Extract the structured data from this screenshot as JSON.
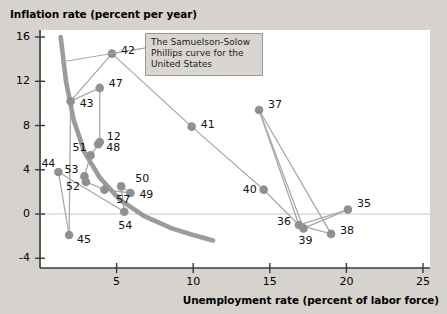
{
  "chart_data": {
    "type": "scatter",
    "title": "",
    "ylabel": "Inflation rate (percent per year)",
    "xlabel": "Unemployment rate (percent of labor force)",
    "xlim": [
      0,
      26
    ],
    "ylim": [
      -4,
      16
    ],
    "xticks": [
      5,
      10,
      15,
      20,
      25
    ],
    "yticks": [
      -4,
      0,
      4,
      8,
      12,
      16
    ],
    "grid": false,
    "zero_line": true,
    "legend": "none",
    "annotation": "The Samuelson-Solow Phillips curve for the United States",
    "point_color": "#8f9092",
    "curve_color": "#9a9b9d",
    "connector_color": "#a8a9ab",
    "points": [
      {
        "label": "35",
        "x": 20.1,
        "y": 0.4,
        "lx": 9,
        "ly": -6
      },
      {
        "label": "36",
        "x": 16.9,
        "y": -1.0,
        "lx": -22,
        "ly": -3
      },
      {
        "label": "37",
        "x": 14.3,
        "y": 9.4,
        "lx": 9,
        "ly": -5
      },
      {
        "label": "38",
        "x": 19.0,
        "y": -1.8,
        "lx": 9,
        "ly": -3
      },
      {
        "label": "39",
        "x": 17.2,
        "y": -1.3,
        "lx": -5,
        "ly": 13
      },
      {
        "label": "40",
        "x": 14.6,
        "y": 2.2,
        "lx": -21,
        "ly": 0
      },
      {
        "label": "41",
        "x": 9.9,
        "y": 7.9,
        "lx": 9,
        "ly": -2
      },
      {
        "label": "42",
        "x": 4.7,
        "y": 14.5,
        "lx": 9,
        "ly": -3
      },
      {
        "label": "43",
        "x": 2.0,
        "y": 10.2,
        "lx": 9,
        "ly": 3
      },
      {
        "label": "44",
        "x": 1.2,
        "y": 3.8,
        "lx": -17,
        "ly": -8
      },
      {
        "label": "45",
        "x": 1.9,
        "y": -1.9,
        "lx": 8,
        "ly": 5
      },
      {
        "label": "47",
        "x": 3.9,
        "y": 11.4,
        "lx": 9,
        "ly": -4
      },
      {
        "label": "48",
        "x": 3.8,
        "y": 6.3,
        "lx": 8,
        "ly": 4
      },
      {
        "label": "49",
        "x": 5.9,
        "y": 1.9,
        "lx": 9,
        "ly": 2
      },
      {
        "label": "50",
        "x": 5.3,
        "y": 2.5,
        "lx": 14,
        "ly": -7
      },
      {
        "label": "51",
        "x": 3.3,
        "y": 5.3,
        "lx": -18,
        "ly": -7
      },
      {
        "label": "52",
        "x": 3.0,
        "y": 2.9,
        "lx": -20,
        "ly": 5
      },
      {
        "label": "53",
        "x": 2.9,
        "y": 3.4,
        "lx": -20,
        "ly": -6
      },
      {
        "label": "54",
        "x": 5.5,
        "y": 0.2,
        "lx": -6,
        "ly": 14
      },
      {
        "label": "57",
        "x": 4.2,
        "y": 2.2,
        "lx": 12,
        "ly": 10
      },
      {
        "label": "12",
        "x": 3.9,
        "y": 6.5,
        "lx": 7,
        "ly": -5
      }
    ],
    "path_order": [
      "35",
      "36",
      "37",
      "38",
      "39",
      "40",
      "41",
      "42",
      "43",
      "44",
      "45",
      "47",
      "48",
      "49",
      "50",
      "51",
      "52",
      "53",
      "54",
      "57"
    ],
    "fitted_curve": [
      {
        "x": 1.35,
        "y": 16.0
      },
      {
        "x": 1.7,
        "y": 12.0
      },
      {
        "x": 2.2,
        "y": 8.5
      },
      {
        "x": 2.9,
        "y": 5.6
      },
      {
        "x": 3.9,
        "y": 3.3
      },
      {
        "x": 5.2,
        "y": 1.3
      },
      {
        "x": 6.8,
        "y": -0.2
      },
      {
        "x": 8.6,
        "y": -1.3
      },
      {
        "x": 10.0,
        "y": -1.9
      },
      {
        "x": 11.3,
        "y": -2.4
      }
    ],
    "connector_segments": [
      [
        "42",
        "43"
      ],
      [
        "43",
        "47"
      ],
      [
        "47",
        "12"
      ],
      [
        "12",
        "48"
      ],
      [
        "48",
        "51"
      ],
      [
        "51",
        "53"
      ],
      [
        "53",
        "52"
      ],
      [
        "52",
        "57"
      ],
      [
        "57",
        "49"
      ],
      [
        "49",
        "50"
      ],
      [
        "50",
        "54"
      ],
      [
        "54",
        "44"
      ],
      [
        "44",
        "45"
      ],
      [
        "45",
        "43"
      ],
      [
        "42",
        "41"
      ],
      [
        "41",
        "40"
      ],
      [
        "40",
        "36"
      ],
      [
        "36",
        "37"
      ],
      [
        "37",
        "39"
      ],
      [
        "37",
        "38"
      ],
      [
        "39",
        "35"
      ],
      [
        "38",
        "36"
      ],
      [
        "35",
        "36"
      ]
    ]
  }
}
